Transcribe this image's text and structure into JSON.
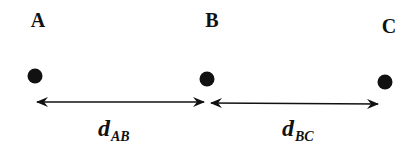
{
  "diagram": {
    "colors": {
      "ink": "#111111",
      "background": "#ffffff"
    },
    "points": [
      {
        "label": "A",
        "x": 35,
        "y": 76,
        "label_x": 38,
        "label_y": 27
      },
      {
        "label": "B",
        "x": 207,
        "y": 79,
        "label_x": 212,
        "label_y": 27
      },
      {
        "label": "C",
        "x": 385,
        "y": 82,
        "label_x": 389,
        "label_y": 33
      }
    ],
    "distances": [
      {
        "symbol": "d",
        "subscript": "AB",
        "from": "A",
        "to": "B"
      },
      {
        "symbol": "d",
        "subscript": "BC",
        "from": "B",
        "to": "C"
      }
    ]
  }
}
